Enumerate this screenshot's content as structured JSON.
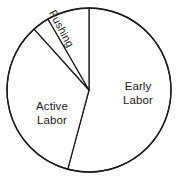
{
  "chart_data": {
    "type": "pie",
    "title": "",
    "subtitle": "",
    "xlabel": "",
    "ylabel": "",
    "legend_position": "none",
    "grid": false,
    "labels_inside": true,
    "center": {
      "x": 89,
      "y": 90
    },
    "radius": 82,
    "start_angle_deg": 0,
    "direction": "clockwise",
    "categories": [
      "Early Labor",
      "Active Labor",
      "",
      "Pushing"
    ],
    "values": [
      54.2,
      34.2,
      3.3,
      8.3
    ],
    "slices": [
      {
        "label": "Early Labor",
        "value": 54.2,
        "start_deg": 0,
        "end_deg": 195,
        "fill": "#ffffff",
        "stroke": "#1a1a1a",
        "label_visible": true,
        "label_lines": "Early\nLabor",
        "label_rotation_deg": 0
      },
      {
        "label": "Active Labor",
        "value": 34.2,
        "start_deg": 195,
        "end_deg": 318,
        "fill": "#ffffff",
        "stroke": "#1a1a1a",
        "label_visible": true,
        "label_lines": "Active\nLabor",
        "label_rotation_deg": 0
      },
      {
        "label": "",
        "value": 3.3,
        "start_deg": 318,
        "end_deg": 330,
        "fill": "#ffffff",
        "stroke": "#1a1a1a",
        "label_visible": false,
        "label_lines": "",
        "label_rotation_deg": 0
      },
      {
        "label": "Pushing",
        "value": 8.3,
        "start_deg": 330,
        "end_deg": 360,
        "fill": "#ffffff",
        "stroke": "#1a1a1a",
        "label_visible": true,
        "label_lines": "Pushing",
        "label_rotation_deg": 62
      }
    ]
  },
  "labels": {
    "early_labor": "Early\nLabor",
    "active_labor": "Active\nLabor",
    "pushing": "Pushing"
  },
  "colors": {
    "stroke": "#1a1a1a",
    "fill": "#ffffff",
    "background": "#ffffff",
    "text": "#1a1a1a"
  }
}
